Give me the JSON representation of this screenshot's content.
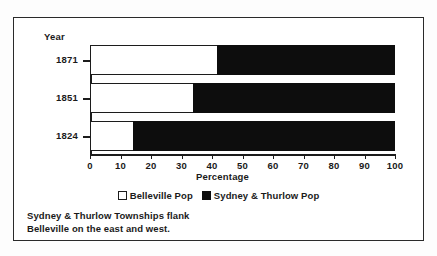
{
  "chart_data": {
    "type": "bar",
    "orientation": "horizontal",
    "stacked": true,
    "normalized": true,
    "title": "",
    "xlabel": "Percentage",
    "ylabel": "Year",
    "categories": [
      "1871",
      "1851",
      "1824"
    ],
    "xlim": [
      0,
      100
    ],
    "xticks": [
      "0",
      "10",
      "20",
      "30",
      "40",
      "50",
      "60",
      "70",
      "80",
      "90",
      "100"
    ],
    "xtick_values": [
      0,
      10,
      20,
      30,
      40,
      50,
      60,
      70,
      80,
      90,
      100
    ],
    "grid": false,
    "legend_position": "bottom-center",
    "series": [
      {
        "name": "Belleville Pop",
        "color": "#ffffff",
        "values": [
          41.6,
          33.8,
          14.0
        ]
      },
      {
        "name": "Sydney & Thurlow Pop",
        "color": "#0d0d0d",
        "values": [
          58.4,
          66.2,
          86.0
        ]
      }
    ],
    "annotation": "Sydney & Thurlow Townships flank Belleville on the east and west."
  },
  "axes": {
    "year_label": "Year",
    "x_title": "Percentage"
  },
  "legend": {
    "items": [
      {
        "label": "Belleville Pop",
        "swatch": "light-square-swatch"
      },
      {
        "label": "Sydney & Thurlow Pop",
        "swatch": "dark-square-swatch"
      }
    ]
  },
  "caption": {
    "line1": "Sydney & Thurlow Townships flank",
    "line2": "Belleville on the east and west."
  }
}
